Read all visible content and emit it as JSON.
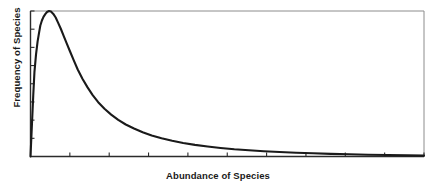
{
  "chart_data": {
    "type": "line",
    "title": "",
    "subtitle": "",
    "xlabel": "Abundance of Species",
    "ylabel": "Frequency of Species",
    "xlim": [
      0,
      100
    ],
    "ylim": [
      0,
      100
    ],
    "grid": false,
    "legend": null,
    "annotations": [],
    "xtick_labels": [],
    "ytick_labels": [],
    "xticks": [
      0,
      10,
      20,
      30,
      40,
      50,
      60,
      70,
      80,
      90,
      100
    ],
    "yticks": [
      0,
      12.5,
      25,
      37.5,
      50,
      62.5,
      75,
      87.5,
      100
    ],
    "series": [
      {
        "name": "Species abundance distribution",
        "color": "#1a1a1a",
        "x": [
          0.0,
          0.3,
          0.7,
          1.0,
          1.4,
          1.8,
          2.2,
          2.5,
          2.9,
          3.3,
          3.8,
          4.2,
          4.7,
          5.2,
          5.8,
          6.4,
          7.0,
          7.7,
          8.4,
          9.2,
          10.0,
          11.0,
          12.0,
          13.2,
          14.5,
          15.8,
          17.2,
          18.8,
          20.5,
          22.3,
          24.2,
          26.3,
          28.5,
          30.8,
          33.3,
          36.0,
          38.8,
          41.8,
          45.0,
          48.3,
          51.8,
          55.5,
          59.3,
          63.3,
          67.5,
          71.8,
          76.3,
          81.0,
          85.8,
          90.8,
          95.8,
          100.0
        ],
        "y": [
          0.0,
          18.0,
          42.0,
          58.0,
          70.0,
          79.0,
          85.5,
          90.0,
          93.5,
          96.0,
          98.0,
          99.3,
          100.0,
          99.6,
          98.0,
          95.5,
          92.0,
          87.8,
          83.0,
          77.8,
          72.5,
          66.0,
          59.8,
          53.5,
          47.5,
          42.2,
          37.3,
          32.8,
          28.8,
          25.2,
          22.0,
          19.2,
          16.7,
          14.5,
          12.5,
          10.8,
          9.3,
          8.0,
          6.9,
          5.9,
          5.0,
          4.3,
          3.6,
          3.1,
          2.6,
          2.2,
          1.8,
          1.5,
          1.2,
          1.0,
          0.8,
          0.6
        ]
      }
    ]
  },
  "axes": {
    "frame_color": "#8c8c8c",
    "axis_color": "#2b2b2b",
    "tick_color": "#2b2b2b",
    "curve_color": "#1a1a1a",
    "background": "#ffffff"
  },
  "labels": {
    "x_axis_title": "Abundance of Species",
    "y_axis_title": "Frequency of Species"
  }
}
